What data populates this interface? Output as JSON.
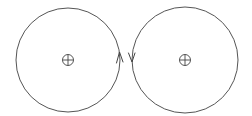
{
  "diagram": {
    "loops": [
      {
        "id": "left",
        "center_marker": "circled-cross",
        "arrow_direction": "up",
        "arrow_side": "right",
        "stroke_color": "#555555"
      },
      {
        "id": "right",
        "center_marker": "circled-cross",
        "arrow_direction": "down",
        "arrow_side": "left",
        "stroke_color": "#555555"
      }
    ],
    "background_color": "#ffffff"
  }
}
